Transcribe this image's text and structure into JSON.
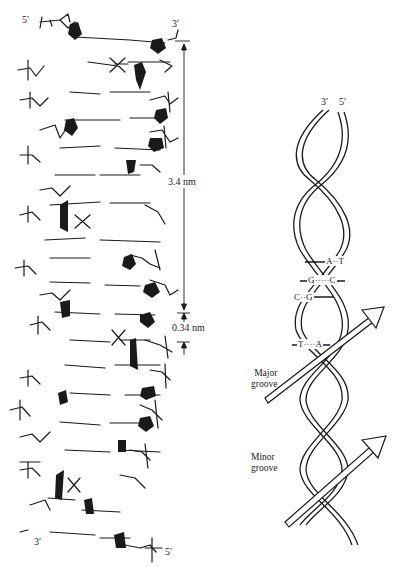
{
  "figure": {
    "left_panel": {
      "title": "Space-filling / stick model of B-DNA",
      "labels": {
        "top_left_end": "5′",
        "top_right_end": "3′",
        "bottom_left_end": "3′",
        "bottom_right_end": "5′"
      },
      "dimensions": {
        "helix_pitch": "3.4 nm",
        "base_pair_rise": "0.34 nm"
      }
    },
    "right_panel": {
      "title": "Ribbon model of DNA double helix",
      "labels": {
        "top_strand_a": "3′",
        "top_strand_b": "5′",
        "major_groove": [
          "Major",
          "groove"
        ],
        "minor_groove": [
          "Minor",
          "groove"
        ]
      },
      "base_pairs": [
        {
          "left": "A",
          "bond": "··",
          "right": "T"
        },
        {
          "left": "G",
          "bond": "·····",
          "right": "C"
        },
        {
          "left": "C",
          "bond": "··",
          "right": "G"
        },
        {
          "left": "T",
          "bond": "····",
          "right": "A"
        }
      ]
    },
    "colors": {
      "ink": "#1a1a1a",
      "background": "#ffffff"
    }
  }
}
